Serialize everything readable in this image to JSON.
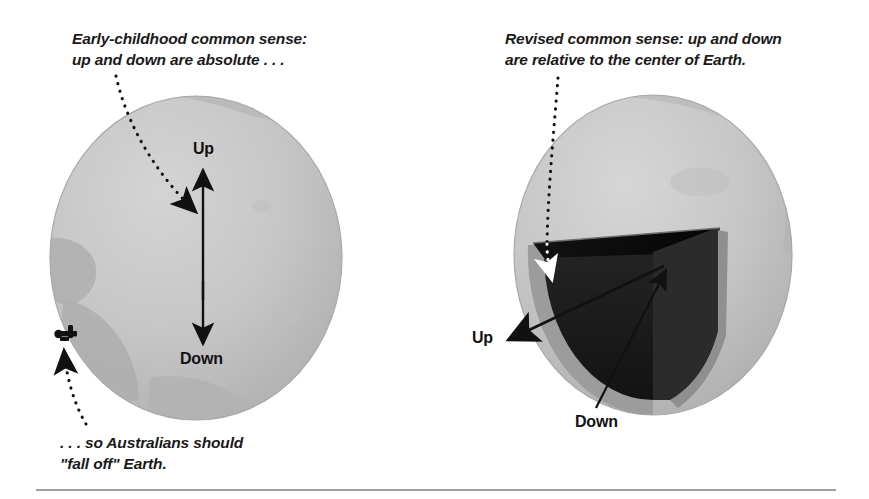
{
  "figure": {
    "background_color": "#ffffff",
    "width": 869,
    "height": 499
  },
  "captions": {
    "left": "Early-childhood common sense:\nup and down are absolute . . .",
    "right": "Revised common sense: up and down\nare relative to the center of Earth.",
    "bottom": ". . . so Australians should\n\"fall off\" Earth."
  },
  "left_panel": {
    "name": "absolute-up-down-globe",
    "label_up": "Up",
    "label_down": "Down",
    "globe_color": "#c4c4c4",
    "globe_shadow_color": "#b0b0b0",
    "landmass_color": "#b2b2b2",
    "figure_color": "#111111",
    "arrow_color": "#111111"
  },
  "right_panel": {
    "name": "relative-up-down-cutaway-globe",
    "label_up": "Up",
    "label_down": "Down",
    "globe_color": "#c4c4c4",
    "globe_shadow_color": "#b0b0b0",
    "wedge_top_face_color": "#0d0d0d",
    "wedge_inner_face_color": "#1e1e1e",
    "wedge_side_face_color": "#2b2b2b",
    "crust_rim_color": "#9a9a9a",
    "arrow_color": "#111111"
  },
  "leaders": {
    "left_top": "dotted-curve-to-up-arrow",
    "left_bottom": "dotted-curve-to-australian-figure",
    "right_top": "dotted-line-to-wedge-interior"
  },
  "rule": {
    "name": "bottom-divider",
    "color": "#9e9e9e",
    "x_start": 36,
    "x_end": 836,
    "y": 490
  }
}
